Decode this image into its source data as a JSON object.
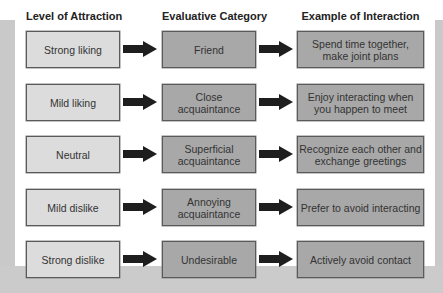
{
  "headers": [
    "Level of Attraction",
    "Evaluative Category",
    "Example of Interaction"
  ],
  "rows": [
    {
      "level": "Strong liking",
      "category": "Friend",
      "interaction": "Spend time together, make joint plans"
    },
    {
      "level": "Mild liking",
      "category": "Close acquaintance",
      "interaction": "Enjoy interacting when you happen to meet"
    },
    {
      "level": "Neutral",
      "category": "Superficial acquaintance",
      "interaction": "Recognize each other and exchange greetings"
    },
    {
      "level": "Mild dislike",
      "category": "Annoying acquaintance",
      "interaction": "Prefer to avoid interacting"
    },
    {
      "level": "Strong dislike",
      "category": "Undesirable",
      "interaction": "Actively avoid contact"
    }
  ],
  "colors": {
    "level_box": "#dcdcdc",
    "category_box": "#a8a8a8",
    "interaction_box": "#a8a8a8",
    "arrow": "#1e1e1e",
    "frame": "#c9c9c9"
  },
  "icons": {
    "connector": "right-arrow-icon"
  }
}
